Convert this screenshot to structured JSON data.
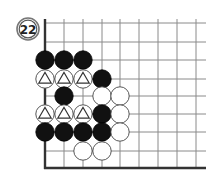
{
  "problem": {
    "number_label": "22"
  },
  "board": {
    "columns_x": [
      45,
      64,
      83,
      102,
      120,
      139,
      158,
      177,
      196
    ],
    "rows_y": [
      23,
      42,
      60,
      79,
      96,
      114,
      132,
      151
    ],
    "edge_left_x": 45,
    "edge_bottom_y": 168,
    "grid_right_x": 206,
    "grid_top_y": 19,
    "stone_radius": 9.2,
    "colors": {
      "line": "#8a8a8a",
      "edge": "#333333",
      "black_stone": "#111111",
      "white_stone": "#ffffff",
      "white_outline": "#444444"
    },
    "stones": [
      {
        "color": "black",
        "col": 0,
        "row": 2,
        "marker": ""
      },
      {
        "color": "black",
        "col": 1,
        "row": 2,
        "marker": ""
      },
      {
        "color": "black",
        "col": 2,
        "row": 2,
        "marker": ""
      },
      {
        "color": "white",
        "col": 0,
        "row": 3,
        "marker": "triangle"
      },
      {
        "color": "white",
        "col": 1,
        "row": 3,
        "marker": "triangle"
      },
      {
        "color": "white",
        "col": 2,
        "row": 3,
        "marker": "triangle"
      },
      {
        "color": "black",
        "col": 3,
        "row": 3,
        "marker": ""
      },
      {
        "color": "black",
        "col": 1,
        "row": 4,
        "marker": ""
      },
      {
        "color": "white",
        "col": 3,
        "row": 4,
        "marker": ""
      },
      {
        "color": "white",
        "col": 4,
        "row": 4,
        "marker": ""
      },
      {
        "color": "white",
        "col": 0,
        "row": 5,
        "marker": "triangle"
      },
      {
        "color": "white",
        "col": 1,
        "row": 5,
        "marker": "triangle"
      },
      {
        "color": "white",
        "col": 2,
        "row": 5,
        "marker": "triangle"
      },
      {
        "color": "black",
        "col": 3,
        "row": 5,
        "marker": ""
      },
      {
        "color": "white",
        "col": 4,
        "row": 5,
        "marker": ""
      },
      {
        "color": "black",
        "col": 0,
        "row": 6,
        "marker": ""
      },
      {
        "color": "black",
        "col": 1,
        "row": 6,
        "marker": ""
      },
      {
        "color": "black",
        "col": 2,
        "row": 6,
        "marker": ""
      },
      {
        "color": "black",
        "col": 3,
        "row": 6,
        "marker": ""
      },
      {
        "color": "white",
        "col": 4,
        "row": 6,
        "marker": ""
      },
      {
        "color": "white",
        "col": 2,
        "row": 7,
        "marker": ""
      },
      {
        "color": "white",
        "col": 3,
        "row": 7,
        "marker": ""
      }
    ]
  }
}
